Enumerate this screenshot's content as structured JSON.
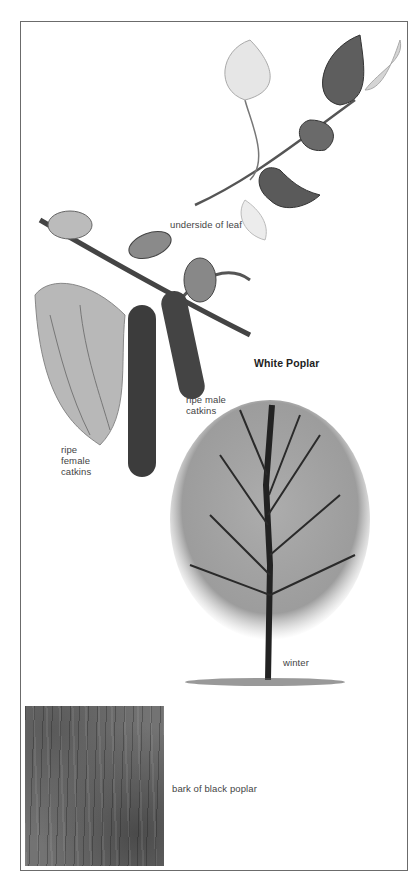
{
  "plate": {
    "title": "White Poplar",
    "labels": {
      "leaf": "underside of leaf",
      "male": [
        "ripe male",
        "catkins"
      ],
      "female": [
        "ripe",
        "female",
        "catkins"
      ],
      "winter": "winter",
      "bark": "bark of black poplar"
    },
    "illustrations": [
      "leaf-spray",
      "catkin-branch",
      "winter-tree",
      "bark-photo"
    ]
  },
  "colors": {
    "frame": "#6b6b6b",
    "ink": "#3a3a3a",
    "bark": "#737373"
  }
}
